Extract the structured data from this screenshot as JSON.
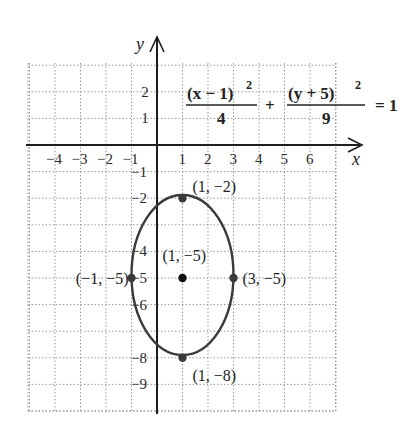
{
  "chart_data": {
    "type": "line",
    "title": "",
    "equation": {
      "term1_numerator": "(x − 1)",
      "term1_exponent": "2",
      "term1_denominator": "4",
      "plus": "+",
      "term2_numerator": "(y + 5)",
      "term2_exponent": "2",
      "term2_denominator": "9",
      "rhs": "= 1"
    },
    "xlabel": "x",
    "ylabel": "y",
    "x_ticks": [
      "−4",
      "−3",
      "−2",
      "−1",
      "1",
      "2",
      "3",
      "4",
      "5",
      "6"
    ],
    "y_ticks": [
      "2",
      "1",
      "−1",
      "−2",
      "−4",
      "−5",
      "−6",
      "−8",
      "−9"
    ],
    "xlim": [
      -5,
      7
    ],
    "ylim": [
      -10,
      3
    ],
    "grid": true,
    "ellipse": {
      "center": [
        1,
        -5
      ],
      "a_x": 2,
      "b_y": 3
    },
    "points": [
      {
        "x": 1,
        "y": -2,
        "label": "(1, −2)"
      },
      {
        "x": 1,
        "y": -5,
        "label": "(1, −5)"
      },
      {
        "x": 1,
        "y": -8,
        "label": "(1, −8)"
      },
      {
        "x": -1,
        "y": -5,
        "label": "(−1, −5)"
      },
      {
        "x": 3,
        "y": -5,
        "label": "(3, −5)"
      }
    ],
    "colors": {
      "curve": "#3a3a3a",
      "grid": "#9a9a9a",
      "axis": "#1e1e1e"
    }
  }
}
